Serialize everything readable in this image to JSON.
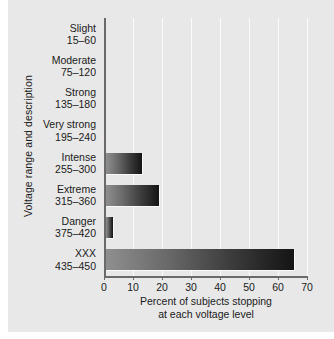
{
  "chart_data": {
    "type": "bar",
    "orientation": "horizontal",
    "title": "",
    "xlabel_line1": "Percent of subjects stopping",
    "xlabel_line2": "at each voltage level",
    "ylabel": "Voltage range and description",
    "xlim": [
      0,
      70
    ],
    "xticks": [
      0,
      10,
      20,
      30,
      40,
      50,
      60,
      70
    ],
    "xtick_labels": [
      "0",
      "10",
      "20",
      "30",
      "40",
      "50",
      "60",
      "70"
    ],
    "grid": true,
    "legend": "none",
    "categories": [
      {
        "name": "Slight",
        "range": "15–60"
      },
      {
        "name": "Moderate",
        "range": "75–120"
      },
      {
        "name": "Strong",
        "range": "135–180"
      },
      {
        "name": "Very strong",
        "range": "195–240"
      },
      {
        "name": "Intense",
        "range": "255–300"
      },
      {
        "name": "Extreme",
        "range": "315–360"
      },
      {
        "name": "Danger",
        "range": "375–420"
      },
      {
        "name": "XXX",
        "range": "435–450"
      }
    ],
    "values": [
      0,
      0,
      0,
      0,
      12.5,
      18.5,
      2.5,
      65
    ],
    "bar_gradient_start": "#8f8f8f",
    "bar_gradient_end": "#141414",
    "background": "#e8e8e8",
    "axis_color": "#6a6a6a",
    "gridline_color": "#fbfbfb"
  }
}
